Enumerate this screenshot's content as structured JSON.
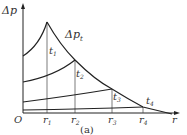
{
  "diagram": {
    "y_axis_label": "Δp",
    "x_axis_label": "r",
    "origin_label": "O",
    "envelope_label": "Δp",
    "envelope_label_sub": "t",
    "time_labels": [
      {
        "main": "t",
        "sub": "1"
      },
      {
        "main": "t",
        "sub": "2"
      },
      {
        "main": "t",
        "sub": "3"
      },
      {
        "main": "t",
        "sub": "4"
      }
    ],
    "radius_labels": [
      {
        "main": "r",
        "sub": "1"
      },
      {
        "main": "r",
        "sub": "2"
      },
      {
        "main": "r",
        "sub": "3"
      },
      {
        "main": "r",
        "sub": "4"
      }
    ],
    "caption": "(a)",
    "line_color": "#222222"
  }
}
